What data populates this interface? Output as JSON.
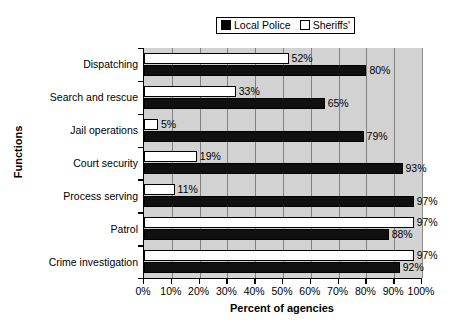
{
  "chart_data": {
    "type": "bar",
    "orientation": "horizontal",
    "title": "",
    "xlabel": "Percent of agencies",
    "ylabel": "Functions",
    "xlim": [
      0,
      100
    ],
    "xtick_labels": [
      "0%",
      "10%",
      "20%",
      "30%",
      "40%",
      "50%",
      "60%",
      "70%",
      "80%",
      "90%",
      "100%"
    ],
    "xtick_values": [
      0,
      10,
      20,
      30,
      40,
      50,
      60,
      70,
      80,
      90,
      100
    ],
    "grid": true,
    "legend_position": "top-center",
    "categories": [
      "Dispatching",
      "Search and rescue",
      "Jail operations",
      "Court security",
      "Process serving",
      "Patrol",
      "Crime investigation"
    ],
    "series": [
      {
        "name": "Local Police",
        "color": "#101010",
        "values": [
          80,
          65,
          79,
          93,
          97,
          88,
          92
        ],
        "labels": [
          "80%",
          "65%",
          "79%",
          "93%",
          "97%",
          "88%",
          "92%"
        ]
      },
      {
        "name": "Sheriffs'",
        "color": "#ffffff",
        "values": [
          52,
          33,
          5,
          19,
          11,
          97,
          97
        ],
        "labels": [
          "52%",
          "33%",
          "5%",
          "19%",
          "11%",
          "97%",
          "97%"
        ]
      }
    ]
  },
  "legend": {
    "items": [
      {
        "label": "Local Police",
        "swatch": "filled-square-black"
      },
      {
        "label": "Sheriffs'",
        "swatch": "open-square-white"
      }
    ]
  },
  "colors": {
    "plot_background": "#d2d2d2",
    "gridline": "#808080",
    "axis": "#000000",
    "page_background": "#ffffff"
  }
}
